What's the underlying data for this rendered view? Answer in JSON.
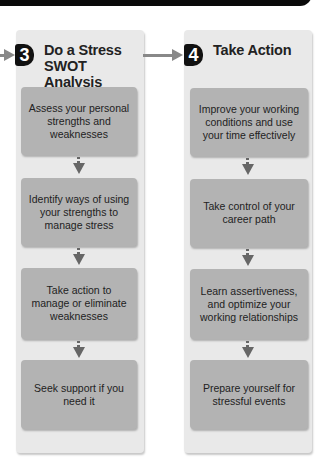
{
  "steps": [
    {
      "number": "3",
      "title": "Do a Stress SWOT Analysis",
      "items": [
        "Assess your personal strengths and weaknesses",
        "Identify ways of using your strengths to manage stress",
        "Take action to manage or eliminate weaknesses",
        "Seek support if you need it"
      ]
    },
    {
      "number": "4",
      "title": "Take Action",
      "items": [
        "Improve your working conditions and use your time effectively",
        "Take control of your career path",
        "Learn assertiveness, and optimize your working relationships",
        "Prepare yourself for stressful events"
      ]
    }
  ],
  "colors": {
    "panel": "#e9e9e9",
    "box": "#b3b3b3",
    "badge": "#111111",
    "connector": "#888888"
  }
}
